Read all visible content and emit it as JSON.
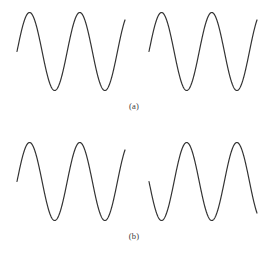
{
  "figure": {
    "background_color": "#ffffff",
    "line_color": "#333333",
    "line_width": 1.2,
    "width": 268,
    "height": 256,
    "caption_a": "(a)",
    "caption_b": "(b)"
  },
  "chart_data": {
    "type": "line",
    "title": "",
    "subtitle": "",
    "xlabel": "",
    "ylabel": "",
    "grid": false,
    "legend": "none",
    "axes_visible": false,
    "panels": [
      {
        "label": "(a)",
        "caption": "(a)",
        "relationship": "in phase",
        "waves": [
          {
            "name": "panel-a-wave-left",
            "amplitude": 39,
            "wavelength": 54,
            "phase_deg": 0,
            "cycles": 2.15,
            "x_start": 17,
            "x_end": 125,
            "y_center": 51.5,
            "y_peak": 12.5,
            "y_trough": 90.5
          },
          {
            "name": "panel-a-wave-right",
            "amplitude": 39,
            "wavelength": 54,
            "phase_deg": 0,
            "cycles": 2.15,
            "x_start": 149,
            "x_end": 257,
            "y_center": 51.5,
            "y_peak": 12.5,
            "y_trough": 90.5
          }
        ]
      },
      {
        "label": "(b)",
        "caption": "(b)",
        "relationship": "out of phase",
        "waves": [
          {
            "name": "panel-b-wave-left",
            "amplitude": 39,
            "wavelength": 54,
            "phase_deg": 0,
            "cycles": 2.15,
            "x_start": 17,
            "x_end": 125,
            "y_center": 181.5,
            "y_peak": 142.5,
            "y_trough": 220.5
          },
          {
            "name": "panel-b-wave-right",
            "amplitude": 39,
            "wavelength": 54,
            "phase_deg": 180,
            "cycles": 2.15,
            "x_start": 149,
            "x_end": 257,
            "y_center": 181.5,
            "y_peak": 142.5,
            "y_trough": 220.5
          }
        ]
      }
    ]
  }
}
